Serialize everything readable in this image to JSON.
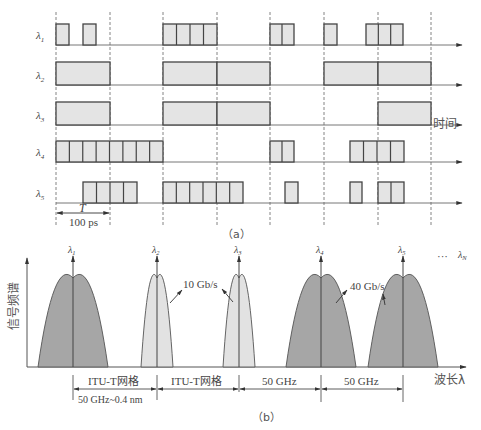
{
  "figure": {
    "part_a": {
      "caption": "（a）",
      "time_axis_label": "时间",
      "period_symbol": "T",
      "period_value": "100 ps",
      "dashed_lines_x": [
        56,
        110,
        163,
        217,
        270,
        324,
        378,
        431
      ],
      "rows": [
        {
          "label": "λ",
          "sub": "1",
          "baseline": 45,
          "height": 21,
          "pulses": [
            [
              56,
              69,
              1
            ],
            [
              83,
              96,
              1
            ],
            [
              163,
              217,
              4
            ],
            [
              270,
              294,
              2
            ],
            [
              324,
              337,
              1
            ],
            [
              366,
              403,
              3
            ]
          ]
        },
        {
          "label": "λ",
          "sub": "2",
          "baseline": 85,
          "height": 23,
          "pulses": [
            [
              56,
              110,
              1
            ],
            [
              163,
              217,
              1
            ],
            [
              217,
              270,
              1
            ],
            [
              324,
              378,
              1
            ],
            [
              378,
              431,
              1
            ]
          ]
        },
        {
          "label": "λ",
          "sub": "3",
          "baseline": 125,
          "height": 23,
          "pulses": [
            [
              56,
              110,
              1
            ],
            [
              163,
              217,
              1
            ],
            [
              217,
              270,
              1
            ],
            [
              378,
              431,
              1
            ]
          ]
        },
        {
          "label": "λ",
          "sub": "4",
          "baseline": 162,
          "height": 21,
          "pulses": [
            [
              56,
              163,
              8
            ],
            [
              270,
              294,
              2
            ],
            [
              350,
              404,
              4
            ]
          ]
        },
        {
          "label": "λ",
          "sub": "5",
          "baseline": 203,
          "height": 21,
          "pulses": [
            [
              83,
              137,
              4
            ],
            [
              163,
              243,
              6
            ],
            [
              285,
              298,
              1
            ],
            [
              350,
              362,
              1
            ],
            [
              378,
              404,
              2
            ]
          ]
        }
      ]
    },
    "part_b": {
      "caption": "（b）",
      "y_axis_label": "信号频谱",
      "x_axis_label": "波长λ",
      "channels": [
        {
          "label": "λ",
          "sub": "1",
          "x": 73,
          "half_width": 35,
          "type": "dark"
        },
        {
          "label": "λ",
          "sub": "2",
          "x": 157,
          "half_width": 16,
          "type": "light"
        },
        {
          "label": "λ",
          "sub": "3",
          "x": 239,
          "half_width": 16,
          "type": "light"
        },
        {
          "label": "λ",
          "sub": "4",
          "x": 321,
          "half_width": 35,
          "type": "dark"
        },
        {
          "label": "λ",
          "sub": "5",
          "x": 403,
          "half_width": 35,
          "type": "dark"
        }
      ],
      "ellipsis": "···",
      "last_channel": {
        "label": "λ",
        "sub": "N"
      },
      "rate_labels": {
        "low": "10 Gb/s",
        "high": "40 Gb/s"
      },
      "spacing_labels": [
        "ITU-T网格",
        "ITU-T网格",
        "50 GHz",
        "50 GHz"
      ],
      "grid_note": "50 GHz~0.4 nm"
    },
    "colors": {
      "pulse_fill": "#e4e4e4",
      "pulse_stroke": "#444444",
      "dark_spectrum": "#a6a6a6",
      "light_spectrum": "#e2e2e2",
      "axis": "#555555",
      "dashed": "#666666"
    }
  }
}
